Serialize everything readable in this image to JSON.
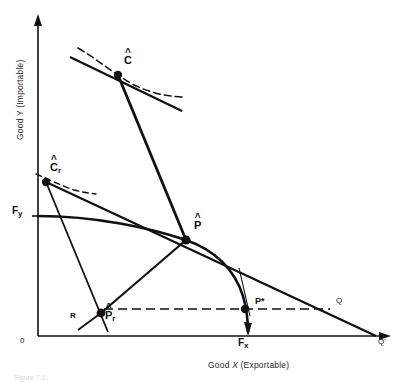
{
  "figure": {
    "kind": "economics-diagram",
    "caption": "Figure 7.1"
  },
  "axes": {
    "x_title_prefix": "Good ",
    "x_title_var": "X",
    "x_title_suffix": " (Exportable)",
    "y_title": "Good Y (Importable)",
    "origin_label": "0"
  },
  "points": [
    {
      "id": "C-hat",
      "base": "C",
      "hat": true,
      "sub": "",
      "star": false,
      "x": 118,
      "y": 75,
      "label_dx": 6,
      "label_dy": -20
    },
    {
      "id": "Cr-hat",
      "base": "C",
      "hat": true,
      "sub": "r",
      "star": false,
      "x": 46,
      "y": 182,
      "label_dx": 4,
      "label_dy": -20
    },
    {
      "id": "P-hat",
      "base": "P",
      "hat": true,
      "sub": "",
      "star": false,
      "x": 186,
      "y": 240,
      "label_dx": 8,
      "label_dy": -20
    },
    {
      "id": "Pr-hat",
      "base": "P",
      "hat": true,
      "sub": "r",
      "star": false,
      "x": 101,
      "y": 313,
      "label_dx": 4,
      "label_dy": -3
    },
    {
      "id": "P-star",
      "base": "P",
      "hat": false,
      "sub": "",
      "star": true,
      "x": 247,
      "y": 310,
      "label_dx": 8,
      "label_dy": -13
    }
  ],
  "markers": {
    "Fy": {
      "text": "F",
      "sub": "y",
      "x": 14,
      "y": 212
    },
    "Fx": {
      "text": "F",
      "sub": "x",
      "x": 240,
      "y": 334
    },
    "R": {
      "text": "R",
      "x": 72,
      "y": 316
    },
    "Q": {
      "text": "Q",
      "x": 337,
      "y": 300
    },
    "Qp": {
      "text": "Q'",
      "x": 380,
      "y": 336
    }
  },
  "curves": {
    "ppf_label": "production-possibility-frontier",
    "budget_line_label": "world-price-line",
    "indifference_label": "indifference-curve"
  },
  "colors": {
    "ink": "#111111",
    "paper": "#ffffff",
    "caption": "#d8d8d8"
  }
}
